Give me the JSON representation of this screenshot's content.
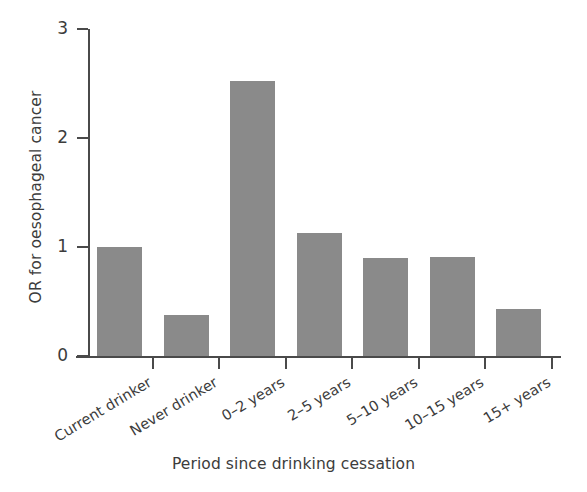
{
  "chart_data": {
    "type": "bar",
    "title": "",
    "subtitle": "",
    "xlabel": "Period since drinking cessation",
    "ylabel": "OR for oesophageal cancer",
    "categories": [
      "Current drinker",
      "Never drinker",
      "0–2 years",
      "2–5 years",
      "5–10 years",
      "10–15 years",
      "15+ years"
    ],
    "values": [
      1.0,
      0.38,
      2.52,
      1.13,
      0.9,
      0.91,
      0.43
    ],
    "ylim": [
      0,
      3
    ],
    "yticks": [
      0,
      1,
      2,
      3
    ],
    "ytick_labels": [
      "0",
      "1",
      "2",
      "3"
    ],
    "grid": false,
    "legend": null,
    "bar_color": "#8a8a8a",
    "axis_color": "#4a4a4a",
    "background_color": "#ffffff"
  }
}
